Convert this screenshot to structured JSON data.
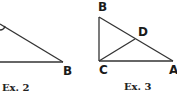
{
  "figures": [
    {
      "caption": "Ex. 2",
      "vertex_labels": {
        "B": "B"
      }
    },
    {
      "caption": "Ex. 3",
      "vertex_labels": {
        "B": "B",
        "D": "D",
        "C": "C",
        "A": "A"
      }
    }
  ],
  "colors": {
    "stroke": "#333333",
    "background": "#ffffff"
  }
}
